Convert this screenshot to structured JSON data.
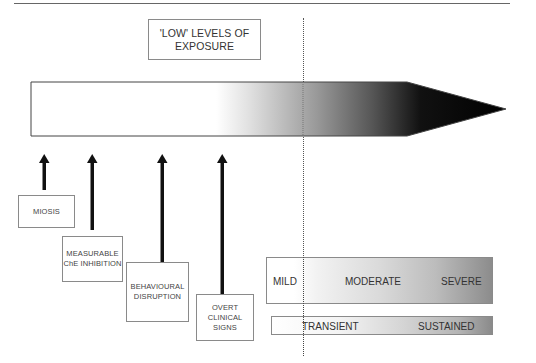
{
  "top_label": {
    "line1": "'LOW' LEVELS OF",
    "line2": "EXPOSURE"
  },
  "exposure_arrow": {
    "description": "gradient arrow from white to black indicating increasing exposure"
  },
  "effects": [
    {
      "line1": "MIOSIS",
      "line2": "",
      "line3": ""
    },
    {
      "line1": "MEASURABLE",
      "line2": "ChE INHIBITION",
      "line3": ""
    },
    {
      "line1": "BEHAVIOURAL",
      "line2": "DISRUPTION",
      "line3": ""
    },
    {
      "line1": "OVERT",
      "line2": "CLINICAL",
      "line3": "SIGNS"
    }
  ],
  "severity": {
    "mild": "MILD",
    "moderate": "MODERATE",
    "severe": "SEVERE"
  },
  "duration": {
    "transient": "TRANSIENT",
    "sustained": "SUSTAINED"
  },
  "colors": {
    "line": "#666666",
    "box_border": "#8a8a8a",
    "arrow_dark": "#000000"
  }
}
